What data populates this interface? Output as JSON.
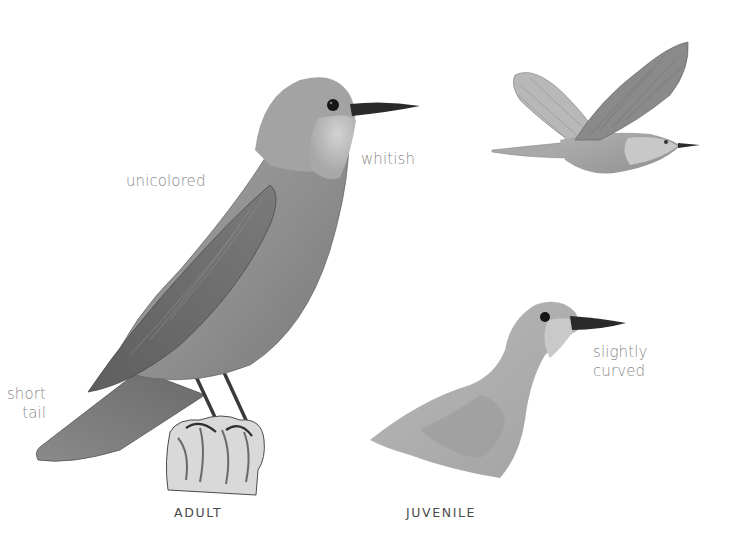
{
  "annotations": {
    "unicolored": "unicolored",
    "whitish": "whitish",
    "short_tail_line1": "short",
    "short_tail_line2": "tail",
    "slightly_curved_line1": "slightly",
    "slightly_curved_line2": "curved"
  },
  "captions": {
    "adult": "ADULT",
    "juvenile": "JUVENILE"
  },
  "colors": {
    "background": "#ffffff",
    "plumage_mid": "#9a9a9a",
    "plumage_dark": "#6e6e6e",
    "throat_light": "#c8c8c8",
    "bill": "#2a2a2a",
    "label_text": "#8a8a8a",
    "caption_text": "#4a4a4a"
  }
}
